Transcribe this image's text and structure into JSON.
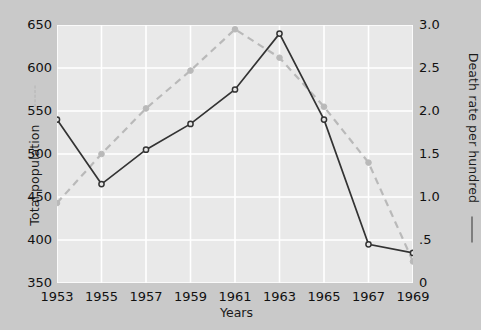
{
  "chart_data": {
    "type": "line",
    "title": "",
    "xlabel": "Years",
    "categories": [
      1953,
      1955,
      1957,
      1959,
      1961,
      1963,
      1965,
      1967,
      1969
    ],
    "xtick_labels": [
      "1953",
      "1955",
      "1957",
      "1959",
      "1961",
      "1963",
      "1965",
      "1967",
      "1969"
    ],
    "grid": true,
    "legend_position": "axis-titles",
    "axes": {
      "left": {
        "label": "Total population",
        "ticks": [
          350,
          400,
          450,
          500,
          550,
          600,
          650
        ],
        "tick_labels": [
          "350",
          "400",
          "450",
          "500",
          "550",
          "600",
          "650"
        ],
        "ylim": [
          350,
          650
        ],
        "marker": "dashed-line"
      },
      "right": {
        "label": "Death rate per hundred",
        "ticks": [
          0,
          0.5,
          1.0,
          1.5,
          2.0,
          2.5,
          3.0
        ],
        "tick_labels": [
          "0",
          ".5",
          "1.0",
          "1.5",
          "2.0",
          "2.5",
          "3.0"
        ],
        "ylim": [
          0,
          3.0
        ],
        "marker": "solid-line"
      }
    },
    "series": [
      {
        "name": "Total population",
        "axis": "left",
        "style": "dashed",
        "color": "#b9b9b9",
        "values": [
          443,
          500,
          553,
          597,
          645,
          612,
          555,
          490,
          375
        ]
      },
      {
        "name": "Death rate per hundred",
        "axis": "right",
        "style": "solid",
        "color": "#333333",
        "values": [
          1.9,
          1.15,
          1.55,
          1.85,
          2.25,
          2.9,
          1.9,
          0.45,
          0.35
        ]
      }
    ]
  },
  "colors": {
    "background": "#c9c9c9",
    "plot_background": "#e9e9e9",
    "gridline": "#ffffff",
    "solid_series": "#333333",
    "dashed_series": "#b9b9b9",
    "text": "#111111"
  }
}
